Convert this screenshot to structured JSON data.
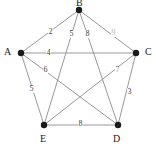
{
  "figure": {
    "kind": "weighted-undirected-graph",
    "background_color": "#ffffff",
    "edge_color": "#8c8c8c",
    "vertex_color": "#1a1a1a",
    "label_color": "#1a1a1a"
  },
  "vertices": [
    {
      "id": "B",
      "label": "B",
      "x": 79,
      "y": 10,
      "label_x": 76,
      "label_y": -2
    },
    {
      "id": "A",
      "label": "A",
      "x": 21,
      "y": 53,
      "label_x": 4,
      "label_y": 47
    },
    {
      "id": "C",
      "label": "C",
      "x": 136,
      "y": 53,
      "label_x": 145,
      "label_y": 47
    },
    {
      "id": "E",
      "label": "E",
      "x": 44,
      "y": 125,
      "label_x": 40,
      "label_y": 134
    },
    {
      "id": "D",
      "label": "D",
      "x": 118,
      "y": 125,
      "label_x": 113,
      "label_y": 134
    }
  ],
  "edges": [
    {
      "from": "A",
      "to": "B",
      "weight": "2",
      "label_x": 48,
      "label_y": 28,
      "tone": "normal"
    },
    {
      "from": "B",
      "to": "E",
      "weight": "5",
      "label_x": 69,
      "label_y": 30,
      "tone": "normal"
    },
    {
      "from": "B",
      "to": "D",
      "weight": "8",
      "label_x": 85,
      "label_y": 30,
      "tone": "normal"
    },
    {
      "from": "B",
      "to": "C",
      "weight": "9",
      "label_x": 111,
      "label_y": 29,
      "tone": "faint"
    },
    {
      "from": "A",
      "to": "C",
      "weight": "4",
      "label_x": 46,
      "label_y": 49,
      "tone": "normal"
    },
    {
      "from": "A",
      "to": "D",
      "weight": "6",
      "label_x": 43,
      "label_y": 66,
      "tone": "normal"
    },
    {
      "from": "A",
      "to": "E",
      "weight": "5",
      "label_x": 29,
      "label_y": 85,
      "tone": "normal"
    },
    {
      "from": "C",
      "to": "E",
      "weight": "7",
      "label_x": 115,
      "label_y": 66,
      "tone": "mid"
    },
    {
      "from": "C",
      "to": "D",
      "weight": "3",
      "label_x": 127,
      "label_y": 88,
      "tone": "normal"
    },
    {
      "from": "D",
      "to": "E",
      "weight": "8",
      "label_x": 78,
      "label_y": 120,
      "tone": "normal"
    }
  ]
}
